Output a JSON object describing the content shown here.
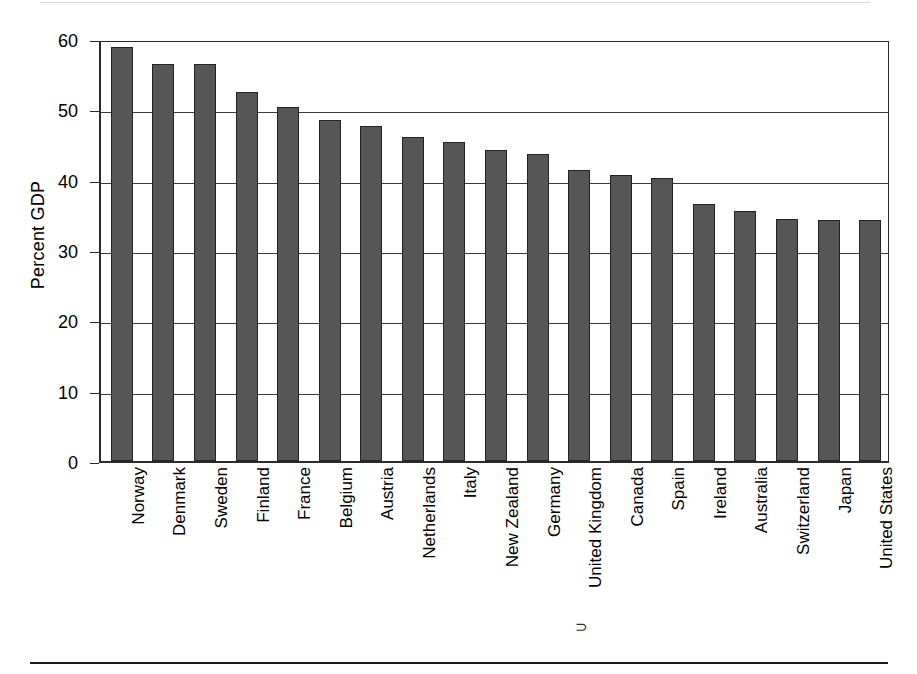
{
  "chart_data": {
    "type": "bar",
    "title": "",
    "subtitle": "",
    "xlabel": "",
    "ylabel": "Percent GDP",
    "ylim": [
      0,
      60
    ],
    "yticks": [
      0,
      10,
      20,
      30,
      40,
      50,
      60
    ],
    "ytick_labels": [
      "0",
      "10",
      "20",
      "30",
      "40",
      "50",
      "60"
    ],
    "grid": "horizontal",
    "legend": "none",
    "bar_color": "#565656",
    "bar_edge_color": "#232323",
    "axis_color": "#2b2b2b",
    "categories": [
      "Norway",
      "Denmark",
      "Sweden",
      "Finland",
      "France",
      "Belgium",
      "Austria",
      "Netherlands",
      "Italy",
      "New Zealand",
      "Germany",
      "United Kingdom",
      "Canada",
      "Spain",
      "Ireland",
      "Australia",
      "Switzerland",
      "Japan",
      "United States"
    ],
    "values": [
      58.9,
      56.5,
      56.4,
      52.4,
      50.4,
      48.5,
      47.6,
      46.1,
      45.3,
      44.2,
      43.6,
      41.4,
      40.6,
      40.3,
      36.5,
      35.5,
      34.4,
      34.3,
      34.2
    ]
  },
  "axis": {
    "y_title": "Percent GDP"
  },
  "artifact": {
    "stray_glyph": "⊃"
  }
}
